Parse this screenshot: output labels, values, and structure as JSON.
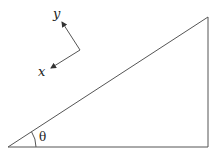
{
  "diagram": {
    "type": "right-triangle-with-rotated-axes",
    "axes": {
      "x_label": "x",
      "y_label": "y"
    },
    "angle_label": "θ",
    "colors": {
      "line": "#555555",
      "text": "#222222",
      "background": "#ffffff"
    }
  }
}
